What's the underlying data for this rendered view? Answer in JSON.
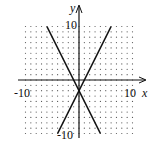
{
  "chart_data": {
    "type": "line",
    "title": "",
    "xlabel": "x",
    "ylabel": "y",
    "xlim": [
      -10,
      10
    ],
    "ylim": [
      -10,
      10
    ],
    "grid": "dotted",
    "tick_labels": {
      "x_min": "-10",
      "x_max": "10",
      "y_max": "10",
      "y_min": "-10"
    },
    "series": [
      {
        "name": "line-1",
        "equation": "y = 2x - 2",
        "x": [
          -4,
          6
        ],
        "y": [
          -10,
          10
        ]
      },
      {
        "name": "line-2",
        "equation": "y = -2x - 2",
        "x": [
          -6,
          4
        ],
        "y": [
          10,
          -10
        ]
      }
    ],
    "intersection": [
      0,
      -2
    ]
  },
  "labels": {
    "x_axis": "x",
    "y_axis": "y",
    "x_min": "-10",
    "x_max": "10",
    "y_max": "10",
    "y_min": "-10"
  },
  "colors": {
    "axis": "#111111",
    "line": "#111111",
    "grid_dot": "#555555"
  }
}
